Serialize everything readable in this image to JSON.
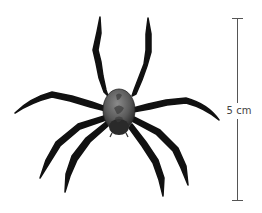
{
  "figure": {
    "colors": {
      "background": "#ffffff",
      "legs": "#111111",
      "body_light": "#7a7a7a",
      "body_dark": "#262626",
      "scale_bar": "#555555"
    }
  },
  "scale_bar": {
    "label": "5 cm",
    "orientation": "vertical"
  }
}
